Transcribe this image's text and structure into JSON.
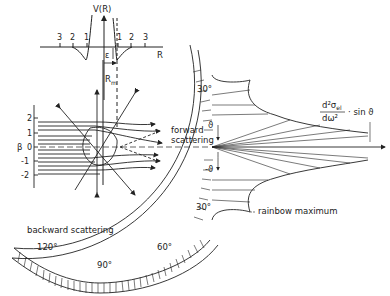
{
  "potential_plot": {
    "y_axis_label": "V(R)",
    "x_axis_label": "R",
    "x_ticks_left": [
      "3",
      "2",
      "1"
    ],
    "x_ticks_right": [
      "1",
      "2",
      "3"
    ],
    "well_depth_label": "ε",
    "min_position_label": "R",
    "min_position_sub": "m"
  },
  "trajectory_plot": {
    "y_axis_label": "β",
    "y_ticks": [
      "2",
      "1",
      "0",
      "-1",
      "-2"
    ],
    "forward_label_1": "forward",
    "forward_label_2": "scattering",
    "backward_label": "backward   scattering"
  },
  "polar_plot": {
    "angle_labels": {
      "top_30": "30°",
      "bottom_30": "30°",
      "a60": "60°",
      "a90": "90°",
      "a120": "120°"
    },
    "theta_label": "ϑ",
    "neg_theta_label": "-ϑ",
    "cross_section_num": "d²σ",
    "cross_section_sub": "el",
    "cross_section_den": "dω²",
    "cross_section_factor": "· sin ϑ",
    "rainbow_label": "rainbow  maximum"
  }
}
